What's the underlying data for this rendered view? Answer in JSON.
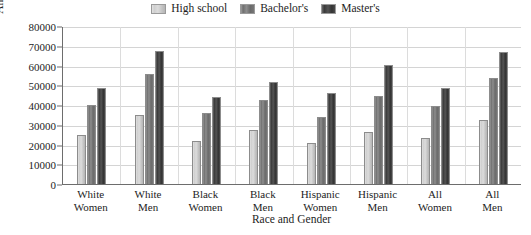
{
  "chart_data": {
    "type": "bar",
    "title": "",
    "xlabel": "Race and Gender",
    "ylabel": "Annual Earnings",
    "ylim": [
      0,
      80000
    ],
    "ytick_values": [
      0,
      10000,
      20000,
      30000,
      40000,
      50000,
      60000,
      70000,
      80000
    ],
    "ytick_labels": [
      "0",
      "10000",
      "20000",
      "30000",
      "40000",
      "50000",
      "60000",
      "70000",
      "80000"
    ],
    "grid": true,
    "legend_position": "top-center",
    "categories": [
      "White Women",
      "White Men",
      "Black Women",
      "Black Men",
      "Hispanic Women",
      "Hispanic Men",
      "All Women",
      "All Men"
    ],
    "category_lines": [
      [
        "White",
        "Women"
      ],
      [
        "White",
        "Men"
      ],
      [
        "Black",
        "Women"
      ],
      [
        "Black",
        "Men"
      ],
      [
        "Hispanic",
        "Women"
      ],
      [
        "Hispanic",
        "Men"
      ],
      [
        "All",
        "Women"
      ],
      [
        "All",
        "Men"
      ]
    ],
    "series": [
      {
        "name": "High school",
        "swatch": "fill-hs",
        "color": "#d2d2d2",
        "values": [
          25000,
          35000,
          22000,
          27500,
          21000,
          26500,
          23500,
          32500
        ]
      },
      {
        "name": "Bachelor's",
        "swatch": "fill-ba",
        "color": "#7b7b7b",
        "values": [
          40000,
          55500,
          36000,
          42500,
          34000,
          44500,
          39500,
          53500
        ]
      },
      {
        "name": "Master's",
        "swatch": "fill-ma",
        "color": "#434343",
        "values": [
          48500,
          67500,
          44000,
          51500,
          46000,
          60500,
          48500,
          67000
        ]
      }
    ]
  }
}
